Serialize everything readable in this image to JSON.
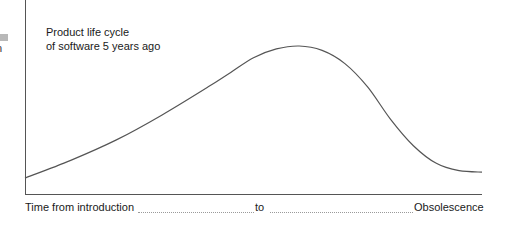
{
  "chart_data": {
    "type": "line",
    "title": "Product life cycle of software 5 years ago",
    "title_lines": [
      "Product life cycle",
      "of software 5 years ago"
    ],
    "xlabel": "Time  from introduction ........ to ........ Obsolescence",
    "xlabel_parts": {
      "start": "Time  from introduction",
      "middle": "to",
      "end": "Obsolescence"
    },
    "ylabel": "",
    "grid": false,
    "legend": "none",
    "x": [
      0,
      0.1,
      0.2,
      0.3,
      0.4,
      0.45,
      0.5,
      0.55,
      0.6,
      0.65,
      0.7,
      0.75,
      0.8,
      0.85,
      0.9,
      0.95,
      1.0
    ],
    "y": [
      0.1,
      0.22,
      0.36,
      0.53,
      0.72,
      0.82,
      0.92,
      0.98,
      1.0,
      0.97,
      0.88,
      0.72,
      0.5,
      0.32,
      0.2,
      0.15,
      0.14
    ],
    "xlim": [
      0,
      1
    ],
    "ylim": [
      0,
      1.05
    ]
  },
  "edge_fragment": {
    "glyph": "n"
  }
}
